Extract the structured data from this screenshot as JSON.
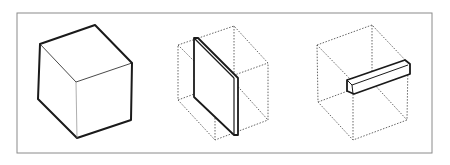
{
  "figure": {
    "colors": {
      "background": "#ffffff",
      "line": "#1a1a1a",
      "frame": "#8a8a8a",
      "dotted": "#555555"
    },
    "panels": [
      {
        "id": "solid-cube",
        "label": "Solid cube"
      },
      {
        "id": "cube-with-slab",
        "label": "Cube outline with vertical slab"
      },
      {
        "id": "cube-with-bar",
        "label": "Cube outline with horizontal bar"
      }
    ]
  }
}
